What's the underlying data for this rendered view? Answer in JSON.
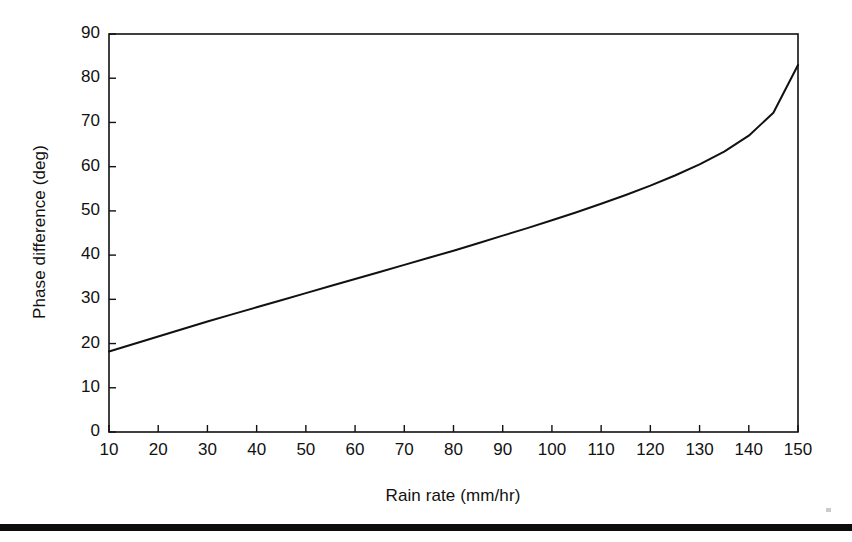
{
  "figure": {
    "background_color": "#ffffff",
    "ink_color": "#111111"
  },
  "chart_data": {
    "type": "line",
    "title": "",
    "xlabel": "Rain rate (mm/hr)",
    "ylabel": "Phase difference (deg)",
    "xlim": [
      10,
      150
    ],
    "ylim": [
      0,
      90
    ],
    "grid": false,
    "legend": null,
    "xticks": [
      10,
      20,
      30,
      40,
      50,
      60,
      70,
      80,
      90,
      100,
      110,
      120,
      130,
      140,
      150
    ],
    "xtick_labels": [
      "10",
      "20",
      "30",
      "40",
      "50",
      "60",
      "70",
      "80",
      "90",
      "100",
      "110",
      "120",
      "130",
      "140",
      "150"
    ],
    "yticks": [
      0,
      10,
      20,
      30,
      40,
      50,
      60,
      70,
      80,
      90
    ],
    "ytick_labels": [
      "0",
      "10",
      "20",
      "30",
      "40",
      "50",
      "60",
      "70",
      "80",
      "90"
    ],
    "series": [
      {
        "name": "Phase difference",
        "color": "#111111",
        "line_width": 2,
        "x": [
          10,
          15,
          20,
          25,
          30,
          35,
          40,
          45,
          50,
          55,
          60,
          65,
          70,
          75,
          80,
          85,
          90,
          95,
          100,
          105,
          110,
          115,
          120,
          125,
          130,
          135,
          140,
          145,
          150
        ],
        "y": [
          18.2,
          19.9,
          21.6,
          23.3,
          25.0,
          26.6,
          28.2,
          29.8,
          31.4,
          33.0,
          34.6,
          36.2,
          37.8,
          39.4,
          41.0,
          42.7,
          44.4,
          46.1,
          47.9,
          49.7,
          51.6,
          53.6,
          55.7,
          58.0,
          60.5,
          63.4,
          67.0,
          72.2,
          83.0
        ]
      }
    ]
  },
  "page": {
    "rule_color": "#0d0d0d"
  }
}
